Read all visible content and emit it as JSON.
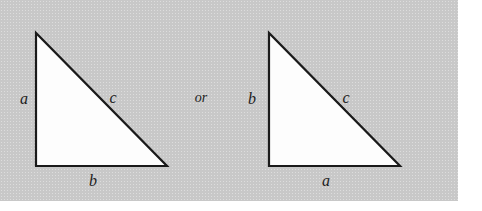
{
  "figure": {
    "background_color": "#c8c8c8",
    "page_color": "#ffffff",
    "stroke_color": "#1a1a1a",
    "fill_color": "#fdfdfd",
    "connector": {
      "text": "or",
      "x": 201,
      "y": 98
    },
    "triangles": [
      {
        "name": "left-triangle",
        "apex": {
          "x": 36,
          "y": 33
        },
        "bottom_left": {
          "x": 36,
          "y": 166
        },
        "bottom_right": {
          "x": 167,
          "y": 166
        },
        "labels": {
          "vertical": {
            "text": "a",
            "x": 24,
            "y": 99
          },
          "hypotenuse": {
            "text": "c",
            "x": 113,
            "y": 98
          },
          "horizontal": {
            "text": "b",
            "x": 93,
            "y": 181
          }
        }
      },
      {
        "name": "right-triangle",
        "apex": {
          "x": 269,
          "y": 33
        },
        "bottom_left": {
          "x": 269,
          "y": 166
        },
        "bottom_right": {
          "x": 400,
          "y": 166
        },
        "labels": {
          "vertical": {
            "text": "b",
            "x": 252,
            "y": 99
          },
          "hypotenuse": {
            "text": "c",
            "x": 346,
            "y": 98
          },
          "horizontal": {
            "text": "a",
            "x": 326,
            "y": 181
          }
        }
      }
    ]
  }
}
